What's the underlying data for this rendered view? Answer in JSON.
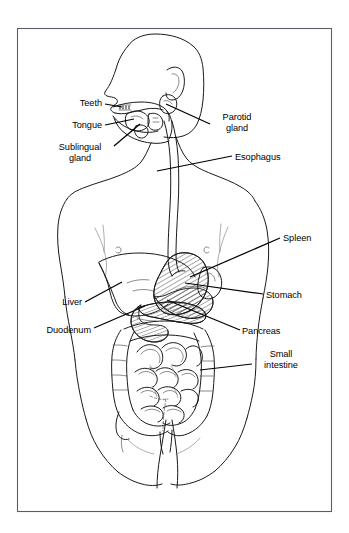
{
  "figure": {
    "kind": "anatomical-line-diagram",
    "orientation": "head in left profile, torso frontal",
    "border": {
      "present": true,
      "color": "#5b5e66",
      "x": 17,
      "y": 28,
      "width": 315,
      "height": 484
    },
    "background_color": "#ffffff",
    "line_color": "#1a1a1a",
    "hatch_fill": "diagonal-hatching"
  },
  "labels": [
    {
      "id": "teeth",
      "text": "Teeth",
      "side": "left",
      "align": "right",
      "text_x": 66,
      "text_y": 98,
      "text_w": 36,
      "leader": [
        [
          105,
          104
        ],
        [
          122,
          107
        ]
      ]
    },
    {
      "id": "tongue",
      "text": "Tongue",
      "side": "left",
      "align": "right",
      "text_x": 54,
      "text_y": 120,
      "text_w": 48,
      "leader": [
        [
          105,
          125
        ],
        [
          134,
          119
        ]
      ]
    },
    {
      "id": "sublingual-gland",
      "text": "Sublingual\ngland",
      "side": "left",
      "align": "center",
      "text_x": 51,
      "text_y": 142,
      "text_w": 58,
      "leader": [
        [
          114,
          146
        ],
        [
          140,
          124
        ]
      ]
    },
    {
      "id": "parotid-gland",
      "text": "Parotid\ngland",
      "side": "right",
      "align": "left",
      "text_x": 214,
      "text_y": 112,
      "text_w": 44,
      "leader": [
        [
          210,
          124
        ],
        [
          166,
          104
        ]
      ]
    },
    {
      "id": "esophagus",
      "text": "Esophagus",
      "side": "right",
      "align": "left",
      "text_x": 235,
      "text_y": 152,
      "text_w": 62,
      "leader": [
        [
          232,
          156
        ],
        [
          157,
          171
        ]
      ]
    },
    {
      "id": "spleen",
      "text": "Spleen",
      "side": "right",
      "align": "left",
      "text_x": 283,
      "text_y": 233,
      "text_w": 44,
      "leader": [
        [
          280,
          238
        ],
        [
          190,
          277
        ]
      ]
    },
    {
      "id": "stomach",
      "text": "Stomach",
      "side": "right",
      "align": "left",
      "text_x": 266,
      "text_y": 290,
      "text_w": 52,
      "leader": [
        [
          263,
          294
        ],
        [
          185,
          283
        ]
      ]
    },
    {
      "id": "pancreas",
      "text": "Pancreas",
      "side": "right",
      "align": "left",
      "text_x": 242,
      "text_y": 326,
      "text_w": 56,
      "leader": [
        [
          240,
          330
        ],
        [
          167,
          300
        ]
      ]
    },
    {
      "id": "small-intestine",
      "text": "Small\nintestine",
      "side": "right",
      "align": "center",
      "text_x": 254,
      "text_y": 349,
      "text_w": 54,
      "leader": [
        [
          252,
          364
        ],
        [
          200,
          370
        ]
      ]
    },
    {
      "id": "liver",
      "text": "Liver",
      "side": "left",
      "align": "right",
      "text_x": 50,
      "text_y": 297,
      "text_w": 32,
      "leader": [
        [
          85,
          302
        ],
        [
          122,
          282
        ]
      ]
    },
    {
      "id": "duodenum",
      "text": "Duodenum",
      "side": "left",
      "align": "right",
      "text_x": 28,
      "text_y": 325,
      "text_w": 63,
      "leader": [
        [
          94,
          328
        ],
        [
          145,
          306
        ]
      ]
    }
  ]
}
